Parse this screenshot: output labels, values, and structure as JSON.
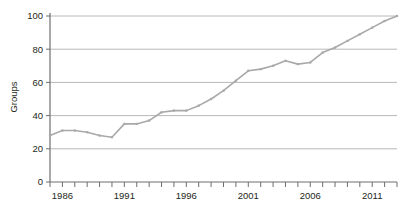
{
  "chart_data": {
    "type": "line",
    "title": "",
    "xlabel": "",
    "ylabel": "Groups",
    "xlim": [
      1985,
      2013
    ],
    "ylim": [
      0,
      100
    ],
    "grid": true,
    "legend": false,
    "legend_position": "none",
    "line_color": "#a9a9a9",
    "axis_color": "#6d6e70",
    "grid_color": "#a6a6a6",
    "text_color": "#231f20",
    "y_ticks": [
      0,
      20,
      40,
      60,
      80,
      100
    ],
    "y_tick_labels": [
      "0",
      "20",
      "40",
      "60",
      "80",
      "100"
    ],
    "x_ticks": [
      1985,
      1986,
      1987,
      1988,
      1989,
      1990,
      1991,
      1992,
      1993,
      1994,
      1995,
      1996,
      1997,
      1998,
      1999,
      2000,
      2001,
      2002,
      2003,
      2004,
      2005,
      2006,
      2007,
      2008,
      2009,
      2010,
      2011,
      2012,
      2013
    ],
    "x_tick_labels": [
      "",
      "1986",
      "",
      "",
      "",
      "",
      "1991",
      "",
      "",
      "",
      "",
      "1996",
      "",
      "",
      "",
      "",
      "2001",
      "",
      "",
      "",
      "",
      "2006",
      "",
      "",
      "",
      "",
      "2011",
      "",
      ""
    ],
    "x": [
      1985,
      1986,
      1987,
      1988,
      1989,
      1990,
      1991,
      1992,
      1993,
      1994,
      1995,
      1996,
      1997,
      1998,
      1999,
      2000,
      2001,
      2002,
      2003,
      2004,
      2005,
      2006,
      2007,
      2008,
      2009,
      2010,
      2011,
      2012,
      2013
    ],
    "values": [
      28,
      31,
      31,
      30,
      28,
      27,
      35,
      35,
      37,
      42,
      43,
      43,
      46,
      50,
      55,
      61,
      67,
      68,
      70,
      73,
      71,
      72,
      78,
      81,
      85,
      89,
      93,
      97,
      100
    ],
    "series": [
      {
        "name": "Groups",
        "values": [
          28,
          31,
          31,
          30,
          28,
          27,
          35,
          35,
          37,
          42,
          43,
          43,
          46,
          50,
          55,
          61,
          67,
          68,
          70,
          73,
          71,
          72,
          78,
          81,
          85,
          89,
          93,
          97,
          100
        ]
      }
    ]
  }
}
